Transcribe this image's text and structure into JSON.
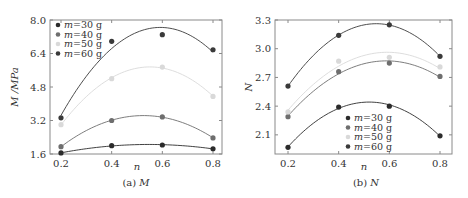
{
  "chart_data": [
    {
      "type": "line",
      "title": "(a) M",
      "caption_prefix": "(a)",
      "caption_var": "M",
      "xlabel": "n",
      "ylabel": "M /MPa",
      "x": [
        0.2,
        0.4,
        0.6,
        0.8
      ],
      "xticks": [
        "0.2",
        "0.4",
        "0.6",
        "0.8"
      ],
      "yticks": [
        "1.6",
        "3.2",
        "4.8",
        "6.4",
        "8.0"
      ],
      "ylim": [
        1.6,
        8.0
      ],
      "xlim": [
        0.15,
        0.84
      ],
      "legend_position": "upper-left",
      "series": [
        {
          "name": "m=30 g",
          "values": [
            1.65,
            2.0,
            2.03,
            1.85
          ],
          "color": "#2b2b2b"
        },
        {
          "name": "m=40 g",
          "values": [
            1.95,
            3.2,
            3.37,
            2.37
          ],
          "color": "#6e6e6e"
        },
        {
          "name": "m=50 g",
          "values": [
            3.0,
            5.2,
            5.75,
            4.35
          ],
          "color": "#d9d9d9"
        },
        {
          "name": "m=60 g",
          "values": [
            3.33,
            6.98,
            7.3,
            6.58
          ],
          "color": "#3a3a3a"
        }
      ]
    },
    {
      "type": "line",
      "title": "(b) N",
      "caption_prefix": "(b)",
      "caption_var": "N",
      "xlabel": "n",
      "ylabel": "N",
      "x": [
        0.2,
        0.4,
        0.6,
        0.8
      ],
      "xticks": [
        "0.2",
        "0.4",
        "0.6",
        "0.8"
      ],
      "yticks": [
        "2.1",
        "2.4",
        "2.7",
        "3.0",
        "3.3"
      ],
      "ylim": [
        1.9,
        3.3
      ],
      "xlim": [
        0.15,
        0.84
      ],
      "legend_position": "lower-center",
      "series": [
        {
          "name": "m=30 g",
          "values": [
            1.97,
            2.39,
            2.4,
            2.09
          ],
          "color": "#2b2b2b"
        },
        {
          "name": "m=40 g",
          "values": [
            2.29,
            2.76,
            2.85,
            2.71
          ],
          "color": "#6e6e6e"
        },
        {
          "name": "m=50 g",
          "values": [
            2.34,
            2.87,
            2.91,
            2.81
          ],
          "color": "#d9d9d9"
        },
        {
          "name": "m=60 g",
          "values": [
            2.61,
            3.14,
            3.25,
            2.92
          ],
          "color": "#3a3a3a"
        }
      ]
    }
  ]
}
